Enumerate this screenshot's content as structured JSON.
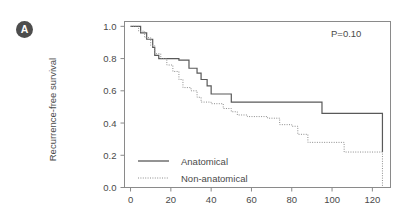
{
  "figure": {
    "panel_label": "A"
  },
  "chart_data": {
    "type": "line",
    "subtype": "kaplan-meier-step",
    "title": "",
    "xlabel": "",
    "ylabel": "Recurrence-free survival",
    "xlim": [
      -3,
      129
    ],
    "ylim": [
      0.0,
      1.03
    ],
    "grid": false,
    "legend_position": "inside-lower-left",
    "annotations": [
      {
        "name": "p-value",
        "text": "P=0.10",
        "x": 100,
        "y": 0.95
      }
    ],
    "xticks": [
      0,
      20,
      40,
      60,
      80,
      100,
      120
    ],
    "xtick_labels": [
      "0",
      "20",
      "40",
      "60",
      "80",
      "100",
      "120"
    ],
    "yticks": [
      0.0,
      0.2,
      0.4,
      0.6,
      0.8,
      1.0
    ],
    "ytick_labels": [
      "0.0",
      "0.2",
      "0.4",
      "0.6",
      "0.8",
      "1.0"
    ],
    "series": [
      {
        "name": "Anatomical",
        "style": "solid",
        "color": "#595959",
        "points": [
          [
            0,
            1.0
          ],
          [
            5,
            1.0
          ],
          [
            5,
            0.96
          ],
          [
            8,
            0.96
          ],
          [
            8,
            0.92
          ],
          [
            11,
            0.92
          ],
          [
            11,
            0.87
          ],
          [
            12,
            0.87
          ],
          [
            12,
            0.82
          ],
          [
            14,
            0.82
          ],
          [
            14,
            0.8
          ],
          [
            24,
            0.8
          ],
          [
            24,
            0.79
          ],
          [
            29,
            0.79
          ],
          [
            29,
            0.74
          ],
          [
            33,
            0.74
          ],
          [
            33,
            0.71
          ],
          [
            35,
            0.71
          ],
          [
            35,
            0.67
          ],
          [
            38,
            0.67
          ],
          [
            38,
            0.63
          ],
          [
            40,
            0.63
          ],
          [
            40,
            0.58
          ],
          [
            50,
            0.58
          ],
          [
            50,
            0.53
          ],
          [
            95,
            0.53
          ],
          [
            95,
            0.46
          ],
          [
            125,
            0.46
          ],
          [
            125,
            0.22
          ]
        ]
      },
      {
        "name": "Non-anatomical",
        "style": "dotted",
        "color": "#8c8c8c",
        "points": [
          [
            0,
            1.0
          ],
          [
            4,
            1.0
          ],
          [
            4,
            0.97
          ],
          [
            7,
            0.97
          ],
          [
            7,
            0.93
          ],
          [
            10,
            0.93
          ],
          [
            10,
            0.88
          ],
          [
            12,
            0.88
          ],
          [
            12,
            0.83
          ],
          [
            15,
            0.83
          ],
          [
            15,
            0.8
          ],
          [
            18,
            0.8
          ],
          [
            18,
            0.76
          ],
          [
            21,
            0.76
          ],
          [
            21,
            0.72
          ],
          [
            24,
            0.72
          ],
          [
            24,
            0.67
          ],
          [
            26,
            0.67
          ],
          [
            26,
            0.62
          ],
          [
            30,
            0.62
          ],
          [
            30,
            0.6
          ],
          [
            33,
            0.6
          ],
          [
            33,
            0.56
          ],
          [
            35,
            0.56
          ],
          [
            35,
            0.53
          ],
          [
            40,
            0.53
          ],
          [
            40,
            0.52
          ],
          [
            46,
            0.52
          ],
          [
            46,
            0.49
          ],
          [
            50,
            0.49
          ],
          [
            50,
            0.47
          ],
          [
            53,
            0.47
          ],
          [
            53,
            0.45
          ],
          [
            58,
            0.45
          ],
          [
            58,
            0.44
          ],
          [
            68,
            0.44
          ],
          [
            68,
            0.43
          ],
          [
            74,
            0.43
          ],
          [
            74,
            0.39
          ],
          [
            80,
            0.39
          ],
          [
            80,
            0.38
          ],
          [
            83,
            0.38
          ],
          [
            83,
            0.33
          ],
          [
            88,
            0.33
          ],
          [
            88,
            0.28
          ],
          [
            106,
            0.28
          ],
          [
            106,
            0.22
          ],
          [
            125,
            0.22
          ],
          [
            125,
            0.0
          ]
        ]
      }
    ],
    "legend": [
      {
        "label": "Anatomical",
        "style": "solid"
      },
      {
        "label": "Non-anatomical",
        "style": "dotted"
      }
    ]
  }
}
